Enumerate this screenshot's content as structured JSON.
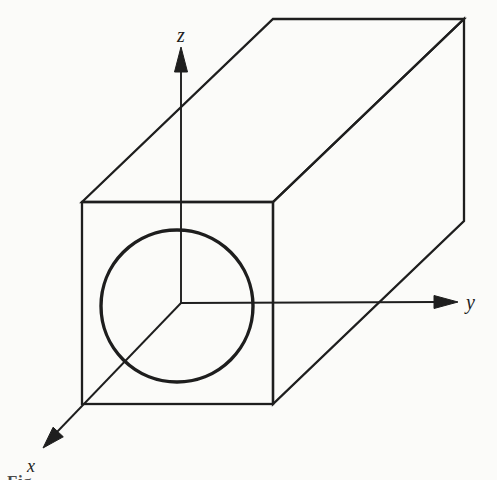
{
  "figure": {
    "colors": {
      "ink": "#1e1e1e",
      "paper": "#fbfbf9",
      "caption": "#4a4a4a"
    },
    "axes": {
      "z_label": "z",
      "y_label": "y",
      "x_label": "x"
    },
    "caption_fragment": "Fig."
  }
}
